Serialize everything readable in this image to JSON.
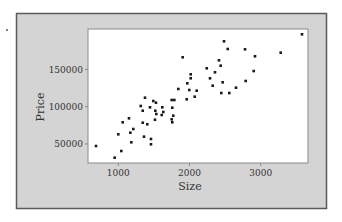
{
  "chart_data": {
    "type": "scatter",
    "title": "",
    "xlabel": "Size",
    "ylabel": "Price",
    "xlim": [
      560,
      3660
    ],
    "ylim": [
      24000,
      204000
    ],
    "xticks": [
      1000,
      2000,
      3000
    ],
    "xtick_labels": [
      "1000",
      "2000",
      "3000"
    ],
    "yticks": [
      50000,
      100000,
      150000
    ],
    "ytick_labels": [
      "50000",
      "100000",
      "150000"
    ],
    "grid": false,
    "legend": null,
    "points": [
      {
        "x": 687,
        "y": 47150
      },
      {
        "x": 949,
        "y": 31450
      },
      {
        "x": 1042,
        "y": 40450
      },
      {
        "x": 1000,
        "y": 62900
      },
      {
        "x": 1062,
        "y": 79000
      },
      {
        "x": 1150,
        "y": 84400
      },
      {
        "x": 1169,
        "y": 65050
      },
      {
        "x": 1211,
        "y": 70000
      },
      {
        "x": 1183,
        "y": 52150
      },
      {
        "x": 1343,
        "y": 78500
      },
      {
        "x": 1407,
        "y": 76350
      },
      {
        "x": 1361,
        "y": 59700
      },
      {
        "x": 1459,
        "y": 56600
      },
      {
        "x": 1459,
        "y": 49450
      },
      {
        "x": 1515,
        "y": 82500
      },
      {
        "x": 1375,
        "y": 112100
      },
      {
        "x": 1492,
        "y": 107650
      },
      {
        "x": 1315,
        "y": 100950
      },
      {
        "x": 1343,
        "y": 94600
      },
      {
        "x": 1445,
        "y": 99200
      },
      {
        "x": 1529,
        "y": 105400
      },
      {
        "x": 1520,
        "y": 94600
      },
      {
        "x": 1534,
        "y": 90200
      },
      {
        "x": 1618,
        "y": 99200
      },
      {
        "x": 1632,
        "y": 92900
      },
      {
        "x": 1610,
        "y": 88850
      },
      {
        "x": 1750,
        "y": 109000
      },
      {
        "x": 1758,
        "y": 98650
      },
      {
        "x": 1772,
        "y": 87900
      },
      {
        "x": 1750,
        "y": 83050
      },
      {
        "x": 1758,
        "y": 79050
      },
      {
        "x": 1904,
        "y": 166400
      },
      {
        "x": 2017,
        "y": 143550
      },
      {
        "x": 2017,
        "y": 138200
      },
      {
        "x": 1969,
        "y": 131450
      },
      {
        "x": 1843,
        "y": 123800
      },
      {
        "x": 1997,
        "y": 122450
      },
      {
        "x": 2101,
        "y": 121500
      },
      {
        "x": 1961,
        "y": 109950
      },
      {
        "x": 2073,
        "y": 113450
      },
      {
        "x": 1787,
        "y": 109000
      },
      {
        "x": 2485,
        "y": 187900
      },
      {
        "x": 2537,
        "y": 177550
      },
      {
        "x": 2780,
        "y": 177150
      },
      {
        "x": 3281,
        "y": 172600
      },
      {
        "x": 2920,
        "y": 167750
      },
      {
        "x": 2414,
        "y": 162350
      },
      {
        "x": 2438,
        "y": 155100
      },
      {
        "x": 2242,
        "y": 151600
      },
      {
        "x": 2358,
        "y": 146250
      },
      {
        "x": 2902,
        "y": 147950
      },
      {
        "x": 2288,
        "y": 138150
      },
      {
        "x": 2466,
        "y": 132800
      },
      {
        "x": 2326,
        "y": 128250
      },
      {
        "x": 2789,
        "y": 134550
      },
      {
        "x": 2653,
        "y": 125550
      },
      {
        "x": 2447,
        "y": 118400
      },
      {
        "x": 2559,
        "y": 118400
      },
      {
        "x": 3580,
        "y": 197300
      }
    ]
  },
  "style": {
    "panel_bg": "#d4d4d4",
    "panel_border": "#5a5a5a",
    "plot_bg": "#ffffff",
    "axis_color": "#8a8a8a",
    "point_color": "#1a1a1a",
    "text_color": "#333333"
  }
}
